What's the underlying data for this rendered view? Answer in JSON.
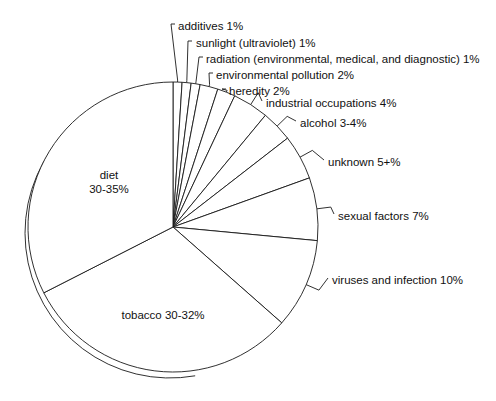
{
  "chart_data": {
    "type": "pie",
    "title": "",
    "subtitle": "",
    "xlabel": "",
    "ylabel": "",
    "legend_position": "none",
    "grid": false,
    "start_angle_deg": 0,
    "direction": "clockwise",
    "center": {
      "x": 173,
      "y": 227
    },
    "radius": 145,
    "style": {
      "slice_fill": "#ffffff",
      "outline": "#1a1a1a",
      "text": "#111111",
      "background": "#ffffff"
    },
    "categories": [
      "additives",
      "sunlight (ultraviolet)",
      "radiation (environmental, medical, and diagnostic)",
      "environmental pollution",
      "heredity",
      "industrial occupations",
      "alcohol",
      "unknown",
      "sexual factors",
      "viruses and infection",
      "tobacco",
      "diet"
    ],
    "values": [
      1,
      1,
      1,
      2,
      2,
      4,
      3.5,
      5,
      7,
      10,
      31,
      32.5
    ],
    "value_labels": [
      "1%",
      "1%",
      "1%",
      "2%",
      "2%",
      "4%",
      "3-4%",
      "5+%",
      "7%",
      "10%",
      "30-32%",
      "30-35%"
    ],
    "slices": [
      {
        "name": "additives",
        "value": 1,
        "value_label": "1%",
        "label_text": "additives 1%",
        "placement": "callout"
      },
      {
        "name": "sunlight (ultraviolet)",
        "value": 1,
        "value_label": "1%",
        "label_text": "sunlight (ultraviolet) 1%",
        "placement": "callout"
      },
      {
        "name": "radiation (environmental, medical, and diagnostic)",
        "value": 1,
        "value_label": "1%",
        "label_text": "radiation (environmental, medical, and diagnostic) 1%",
        "placement": "callout"
      },
      {
        "name": "environmental pollution",
        "value": 2,
        "value_label": "2%",
        "label_text": "environmental pollution 2%",
        "placement": "callout"
      },
      {
        "name": "heredity",
        "value": 2,
        "value_label": "2%",
        "label_text": "heredity 2%",
        "placement": "callout"
      },
      {
        "name": "industrial occupations",
        "value": 4,
        "value_label": "4%",
        "label_text": "industrial occupations 4%",
        "placement": "callout"
      },
      {
        "name": "alcohol",
        "value": 3.5,
        "value_label": "3-4%",
        "label_text": "alcohol 3-4%",
        "placement": "callout"
      },
      {
        "name": "unknown",
        "value": 5,
        "value_label": "5+%",
        "label_text": "unknown 5+%",
        "placement": "callout"
      },
      {
        "name": "sexual factors",
        "value": 7,
        "value_label": "7%",
        "label_text": "sexual factors 7%",
        "placement": "callout"
      },
      {
        "name": "viruses and infection",
        "value": 10,
        "value_label": "10%",
        "label_text": "viruses and infection 10%",
        "placement": "callout"
      },
      {
        "name": "tobacco",
        "value": 31,
        "value_label": "30-32%",
        "label_text": "tobacco 30-32%",
        "placement": "inside"
      },
      {
        "name": "diet",
        "value": 32.5,
        "value_label": "30-35%",
        "label_text": "diet",
        "label_text2": "30-35%",
        "placement": "inside"
      }
    ]
  },
  "labels": {
    "additives": "additives 1%",
    "sunlight": "sunlight (ultraviolet) 1%",
    "radiation": "radiation (environmental, medical, and diagnostic) 1%",
    "pollution": "environmental pollution 2%",
    "heredity": "heredity 2%",
    "industrial": "industrial occupations 4%",
    "alcohol": "alcohol 3-4%",
    "unknown": "unknown 5+%",
    "sexual": "sexual factors 7%",
    "viruses": "viruses and infection 10%",
    "tobacco": "tobacco 30-32%",
    "diet_line1": "diet",
    "diet_line2": "30-35%"
  }
}
